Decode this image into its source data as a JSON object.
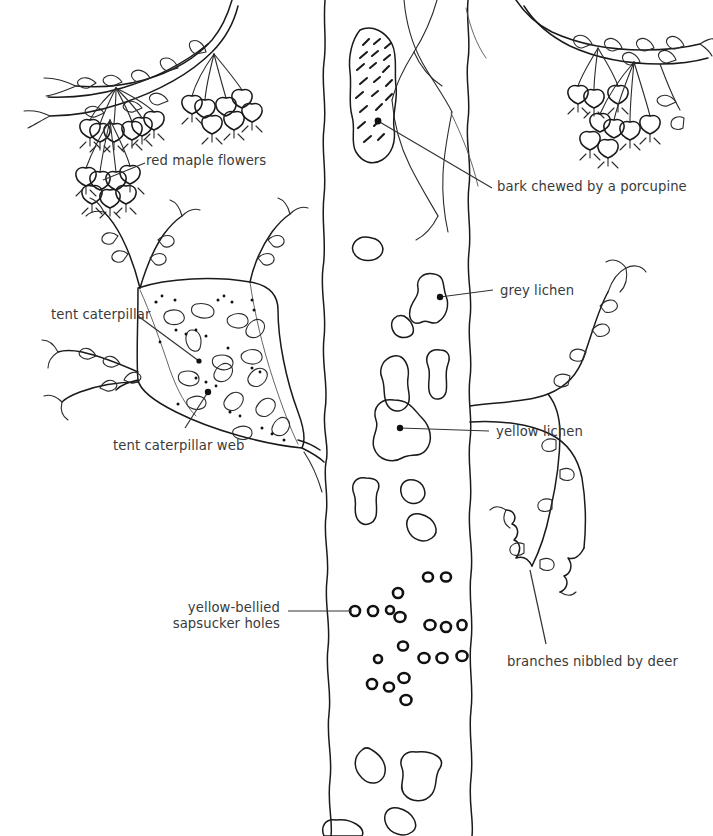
{
  "figure": {
    "background_color": "#ffffff",
    "ink_color": "#1a1a1a",
    "label_color": "#3a3a3a"
  },
  "labels": [
    {
      "id": "red-maple-flowers",
      "text": "red maple flowers",
      "x": 146,
      "y": 153,
      "align": "left",
      "lines": [
        "red maple flowers"
      ]
    },
    {
      "id": "bark-porcupine",
      "text": "bark chewed by a porcupine",
      "x": 497,
      "y": 179,
      "align": "left",
      "lines": [
        "bark chewed by a porcupine"
      ]
    },
    {
      "id": "tent-caterpillar",
      "text": "tent caterpillar",
      "x": 51,
      "y": 307,
      "align": "left",
      "lines": [
        "tent caterpillar"
      ]
    },
    {
      "id": "grey-lichen",
      "text": "grey lichen",
      "x": 500,
      "y": 283,
      "align": "left",
      "lines": [
        "grey lichen"
      ]
    },
    {
      "id": "yellow-lichen",
      "text": "yellow lichen",
      "x": 496,
      "y": 424,
      "align": "left",
      "lines": [
        "yellow lichen"
      ]
    },
    {
      "id": "tent-caterpillar-web",
      "text": "tent caterpillar web",
      "x": 113,
      "y": 438,
      "align": "left",
      "lines": [
        "tent caterpillar web"
      ]
    },
    {
      "id": "sapsucker-holes",
      "text": "yellow-bellied sapsucker holes",
      "x": 190,
      "y": 600,
      "align": "right",
      "lines": [
        "yellow-bellied",
        "sapsucker holes"
      ]
    },
    {
      "id": "branches-deer",
      "text": "branches nibbled by deer",
      "x": 507,
      "y": 654,
      "align": "left",
      "lines": [
        "branches nibbled by deer"
      ]
    }
  ],
  "leaders": [
    {
      "id": "leader-flowers",
      "from": [
        145,
        163
      ],
      "to": [
        103,
        180
      ]
    },
    {
      "id": "leader-porcupine",
      "from": [
        492,
        188
      ],
      "to": [
        378,
        121
      ]
    },
    {
      "id": "leader-caterpillar",
      "from": [
        138,
        316
      ],
      "to": [
        198,
        361
      ]
    },
    {
      "id": "leader-grey",
      "from": [
        493,
        290
      ],
      "to": [
        440,
        297
      ]
    },
    {
      "id": "leader-yellow",
      "from": [
        489,
        431
      ],
      "to": [
        400,
        428
      ]
    },
    {
      "id": "leader-web",
      "from": [
        185,
        428
      ],
      "to": [
        208,
        392
      ]
    },
    {
      "id": "leader-sapsucker",
      "from": [
        288,
        611
      ],
      "to": [
        352,
        611
      ]
    },
    {
      "id": "leader-deer",
      "from": [
        546,
        644
      ],
      "to": [
        530,
        570
      ]
    }
  ],
  "anchor_dots": [
    {
      "id": "dot-porcupine",
      "x": 378,
      "y": 121
    },
    {
      "id": "dot-grey",
      "x": 440,
      "y": 297
    },
    {
      "id": "dot-yellow",
      "x": 400,
      "y": 428
    },
    {
      "id": "dot-web",
      "x": 208,
      "y": 392
    },
    {
      "id": "dot-caterpillar",
      "x": 199,
      "y": 361
    }
  ],
  "features": {
    "trunk": {
      "left_edge_x": 322,
      "right_edge_x": 468,
      "name": "maple-trunk"
    },
    "flower_clusters": 3,
    "lichen_patches": 18,
    "sapsucker_hole_count": 24,
    "porcupine_scar_hatches": 16
  }
}
